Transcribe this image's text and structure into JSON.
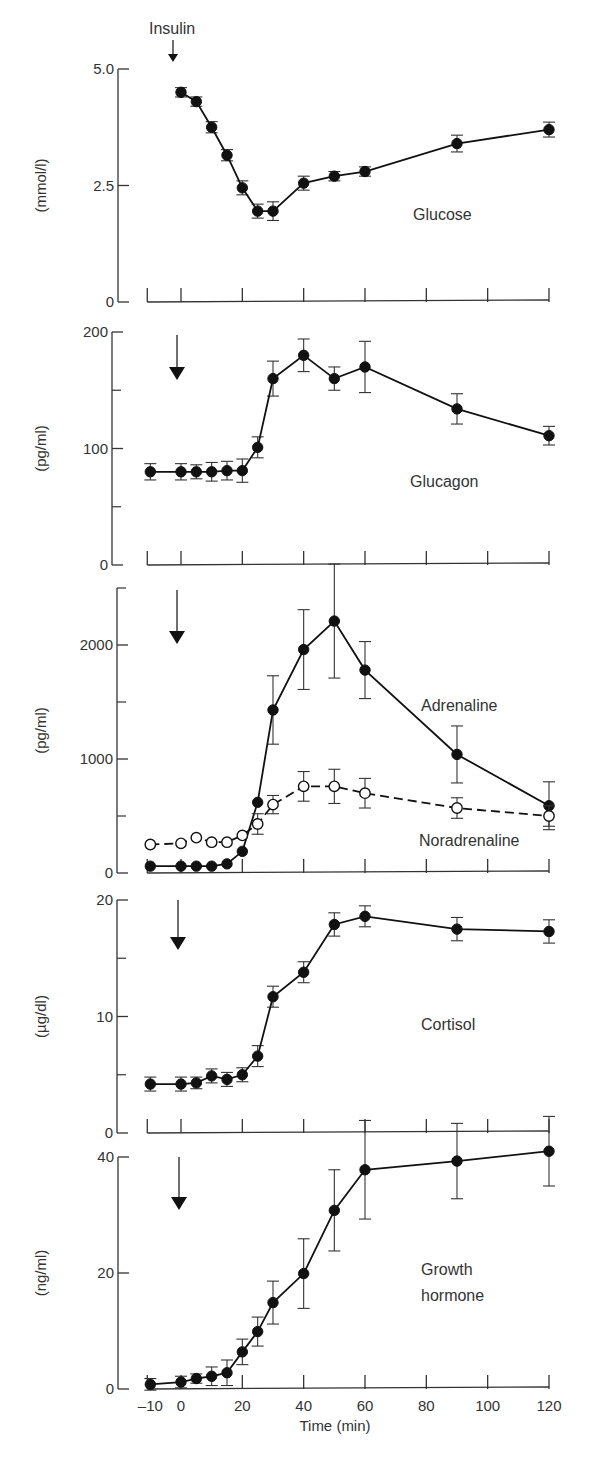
{
  "chart_data": [
    {
      "type": "line",
      "panel": "glucose",
      "title": "",
      "series_label": "Glucose",
      "ylabel": "(mmol/l)",
      "ylim": [
        0,
        5.0
      ],
      "yticks": [
        {
          "v": 0,
          "label": "0"
        },
        {
          "v": 2.5,
          "label": "2.5"
        },
        {
          "v": 5.0,
          "label": "5.0"
        }
      ],
      "yminor": [],
      "annotation": "Insulin",
      "series": [
        {
          "name": "Glucose",
          "style": "filled-solid",
          "x": [
            0,
            5,
            10,
            15,
            20,
            25,
            30,
            40,
            50,
            60,
            90,
            120
          ],
          "y": [
            4.5,
            4.3,
            3.75,
            3.15,
            2.45,
            1.95,
            1.95,
            2.55,
            2.7,
            2.8,
            3.4,
            3.7
          ],
          "err": [
            0.1,
            0.1,
            0.12,
            0.12,
            0.15,
            0.15,
            0.2,
            0.15,
            0.1,
            0.1,
            0.18,
            0.16
          ]
        }
      ]
    },
    {
      "type": "line",
      "panel": "glucagon",
      "series_label": "Glucagon",
      "ylabel": "(pg/ml)",
      "ylim": [
        0,
        200
      ],
      "yticks": [
        {
          "v": 0,
          "label": "0"
        },
        {
          "v": 100,
          "label": "100"
        },
        {
          "v": 200,
          "label": "200"
        }
      ],
      "yminor": [
        50,
        150
      ],
      "series": [
        {
          "name": "Glucagon",
          "style": "filled-solid",
          "x": [
            -10,
            0,
            5,
            10,
            15,
            20,
            25,
            30,
            40,
            50,
            60,
            90,
            120
          ],
          "y": [
            80,
            80,
            80,
            80,
            81,
            81,
            101,
            160,
            180,
            160,
            170,
            134,
            111
          ],
          "err": [
            7,
            7,
            6,
            8,
            8,
            10,
            9,
            15,
            14,
            10,
            22,
            13,
            8
          ]
        }
      ]
    },
    {
      "type": "line",
      "panel": "catecholamines",
      "ylabel": "(pg/ml)",
      "ylim": [
        0,
        2500
      ],
      "yticks": [
        {
          "v": 0,
          "label": "0"
        },
        {
          "v": 1000,
          "label": "1000"
        },
        {
          "v": 2000,
          "label": "2000"
        }
      ],
      "yminor": [
        500,
        1500,
        2500
      ],
      "series": [
        {
          "name": "Adrenaline",
          "style": "filled-solid",
          "x": [
            -10,
            0,
            5,
            10,
            15,
            20,
            25,
            30,
            40,
            50,
            60,
            90,
            120
          ],
          "y": [
            60,
            60,
            60,
            60,
            80,
            190,
            620,
            1430,
            1960,
            2210,
            1780,
            1040,
            590
          ],
          "err": [
            0,
            0,
            0,
            0,
            0,
            0,
            0,
            300,
            350,
            500,
            250,
            250,
            210
          ]
        },
        {
          "name": "Noradrenaline",
          "style": "open-dashed",
          "x": [
            -10,
            0,
            5,
            10,
            15,
            20,
            25,
            30,
            40,
            50,
            60,
            90,
            120
          ],
          "y": [
            250,
            260,
            310,
            270,
            270,
            330,
            430,
            600,
            760,
            760,
            700,
            570,
            500
          ],
          "err": [
            0,
            0,
            0,
            0,
            0,
            0,
            90,
            80,
            130,
            150,
            130,
            90,
            90
          ]
        }
      ]
    },
    {
      "type": "line",
      "panel": "cortisol",
      "series_label": "Cortisol",
      "ylabel": "(µg/dl)",
      "ylim": [
        0,
        20
      ],
      "yticks": [
        {
          "v": 0,
          "label": "0"
        },
        {
          "v": 10,
          "label": "10"
        },
        {
          "v": 20,
          "label": "20"
        }
      ],
      "yminor": [
        5,
        15
      ],
      "series": [
        {
          "name": "Cortisol",
          "style": "filled-solid",
          "x": [
            -10,
            0,
            5,
            10,
            15,
            20,
            25,
            30,
            40,
            50,
            60,
            90,
            120
          ],
          "y": [
            4.2,
            4.2,
            4.3,
            4.9,
            4.6,
            5.0,
            6.6,
            11.7,
            13.8,
            17.9,
            18.6,
            17.5,
            17.3
          ],
          "err": [
            0.6,
            0.6,
            0.5,
            0.6,
            0.6,
            0.6,
            0.9,
            0.9,
            0.9,
            1.0,
            0.9,
            1.0,
            1.0
          ]
        }
      ]
    },
    {
      "type": "line",
      "panel": "growth-hormone",
      "series_label": [
        "Growth",
        "hormone"
      ],
      "ylabel": "(ng/ml)",
      "xlabel": "Time (min)",
      "ylim": [
        0,
        40
      ],
      "yticks": [
        {
          "v": 0,
          "label": "0"
        },
        {
          "v": 20,
          "label": "20"
        },
        {
          "v": 40,
          "label": "40"
        }
      ],
      "yminor": [],
      "series": [
        {
          "name": "Growth hormone",
          "style": "filled-solid",
          "x": [
            -10,
            0,
            5,
            10,
            15,
            20,
            25,
            30,
            40,
            50,
            60,
            90,
            120
          ],
          "y": [
            0.8,
            1.2,
            1.8,
            2.2,
            2.8,
            6.4,
            9.9,
            14.9,
            19.9,
            30.8,
            37.8,
            39.3,
            41.0
          ],
          "err": [
            1.0,
            1.0,
            0.8,
            1.6,
            2.2,
            2.2,
            2.5,
            3.7,
            6.0,
            7.0,
            8.5,
            6.5,
            6.0
          ]
        }
      ]
    }
  ],
  "xaxis": {
    "label": "Time (min)",
    "ticks": [
      {
        "v": -10,
        "label": "–10"
      },
      {
        "v": 0,
        "label": "0"
      },
      {
        "v": 20,
        "label": "20"
      },
      {
        "v": 40,
        "label": "40"
      },
      {
        "v": 60,
        "label": "60"
      },
      {
        "v": 80,
        "label": "80"
      },
      {
        "v": 100,
        "label": "100"
      },
      {
        "v": 120,
        "label": "120"
      }
    ],
    "range": [
      -10,
      120
    ]
  },
  "labels": {
    "insulin": "Insulin",
    "glucose": "Glucose",
    "glucagon": "Glucagon",
    "adrenaline": "Adrenaline",
    "noradrenaline": "Noradrenaline",
    "cortisol": "Cortisol",
    "gh_line1": "Growth",
    "gh_line2": "hormone",
    "time": "Time (min)"
  }
}
